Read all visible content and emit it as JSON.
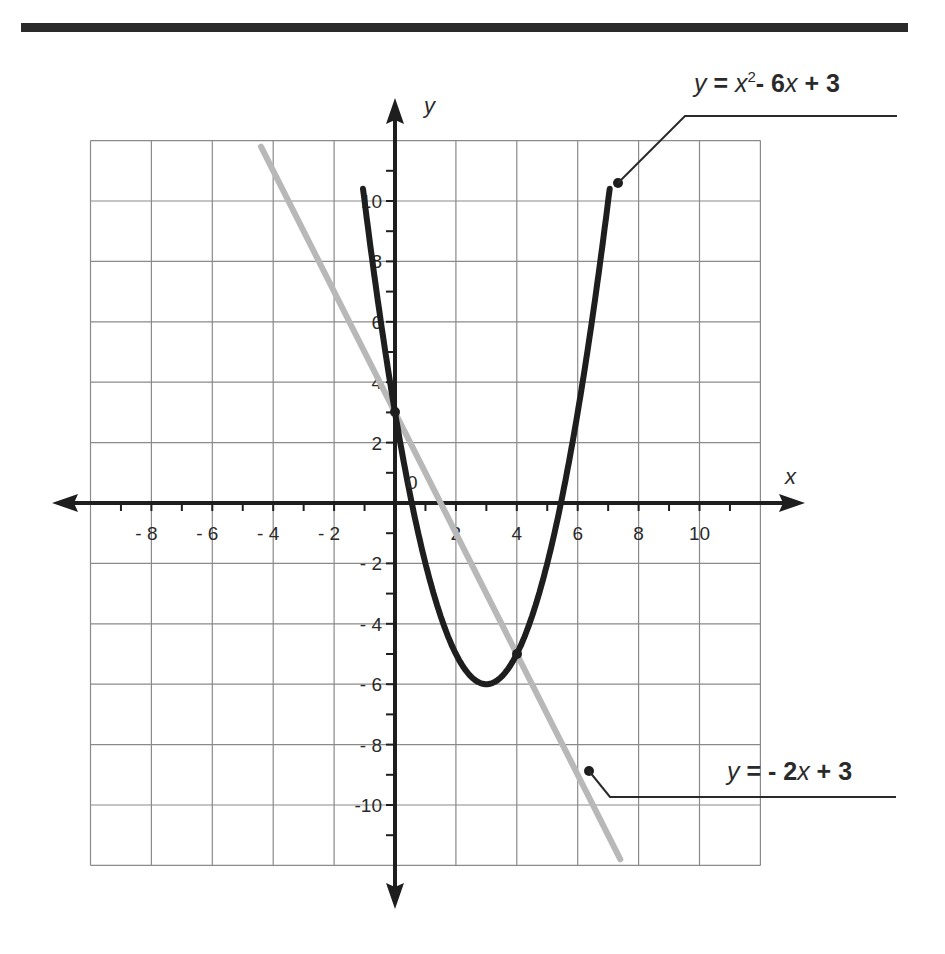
{
  "chart_data": {
    "type": "line",
    "title": "",
    "xlabel": "x",
    "ylabel": "y",
    "xlim": [
      -10,
      12
    ],
    "ylim": [
      -12,
      12
    ],
    "grid": true,
    "grid_step": 2,
    "x_tick_labels": [
      "- 8",
      "- 6",
      "- 4",
      "- 2",
      "2",
      "4",
      "6",
      "8",
      "10"
    ],
    "x_tick_values": [
      -8,
      -6,
      -4,
      -2,
      2,
      4,
      6,
      8,
      10
    ],
    "y_tick_labels": [
      "10",
      "8",
      "6",
      "4",
      "2",
      "- 2",
      "- 4",
      "- 6",
      "- 8",
      "-10"
    ],
    "y_tick_values": [
      10,
      8,
      6,
      4,
      2,
      -2,
      -4,
      -6,
      -8,
      -10
    ],
    "origin_label": "0",
    "series": [
      {
        "name": "y = x² - 6x + 3",
        "kind": "parabola",
        "coefficients": {
          "a": 1,
          "b": -6,
          "c": 3
        },
        "x_range": [
          -1.05,
          7.05
        ],
        "color": "#1e1e1e",
        "points": [
          [
            -1,
            10
          ],
          [
            0,
            3
          ],
          [
            1,
            -2
          ],
          [
            2,
            -5
          ],
          [
            3,
            -6
          ],
          [
            4,
            -5
          ],
          [
            5,
            -2
          ],
          [
            6,
            3
          ],
          [
            7,
            10
          ]
        ]
      },
      {
        "name": "y = - 2x + 3",
        "kind": "line",
        "coefficients": {
          "m": -2,
          "b": 3
        },
        "x_range": [
          -4.4,
          7.4
        ],
        "color": "#b8b8b8",
        "points": [
          [
            -4.4,
            11.8
          ],
          [
            0,
            3
          ],
          [
            4,
            -5
          ],
          [
            7.4,
            -11.8
          ]
        ]
      }
    ],
    "highlighted_points": [
      [
        0,
        3
      ],
      [
        4,
        -5
      ]
    ],
    "annotations": [
      {
        "text_parts": [
          "y",
          " = ",
          "x",
          "2",
          "- 6",
          "x",
          " + 3"
        ],
        "target_series": 0
      },
      {
        "text_parts": [
          "y",
          " = - 2",
          "x",
          " + 3"
        ],
        "target_series": 1
      }
    ]
  },
  "labels": {
    "x_axis": "x",
    "y_axis": "y",
    "origin": "0",
    "eq1": {
      "y": "y",
      "eqsign": " = ",
      "x": "x",
      "sup": "2",
      "rest1": "- 6",
      "x2": "x",
      "rest2": " + 3"
    },
    "eq2": {
      "y": "y",
      "rest1": " = - 2",
      "x": "x",
      "rest2": " + 3"
    }
  },
  "colors": {
    "grid": "#8a8a8a",
    "axis": "#1e1e1e",
    "parabola": "#1e1e1e",
    "line": "#b8b8b8",
    "rule": "#2a2a2a"
  }
}
